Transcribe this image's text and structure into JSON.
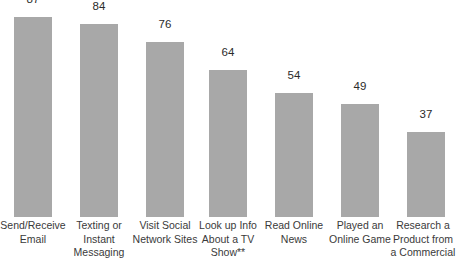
{
  "chart_data": {
    "type": "bar",
    "title": "",
    "xlabel": "",
    "ylabel": "",
    "ylim": [
      0,
      95
    ],
    "grid": false,
    "legend": null,
    "orientation": "vertical",
    "bar_color": "#a8a8a8",
    "background_color": "#ffffff",
    "value_label_color": "#2b2b2b",
    "category_label_color": "#3a3a3a",
    "categories": [
      "Send/Receive Email",
      "Texting or Instant Messaging",
      "Visit Social Network Sites",
      "Look up Info About a TV Show**",
      "Read Online News",
      "Played an Online Game",
      "Research a Product from a Commercial"
    ],
    "category_lines": [
      [
        "Send/Receive",
        "Email"
      ],
      [
        "Texting or",
        "Instant",
        "Messaging"
      ],
      [
        "Visit Social",
        "Network Sites"
      ],
      [
        "Look up Info",
        "About a TV",
        "Show**"
      ],
      [
        "Read Online",
        "News"
      ],
      [
        "Played an",
        "Online Game"
      ],
      [
        "Research a",
        "Product from",
        "a Commercial"
      ]
    ],
    "values": [
      87,
      84,
      76,
      64,
      54,
      49,
      37
    ],
    "value_labels": [
      "87",
      "84",
      "76",
      "64",
      "54",
      "49",
      "37"
    ]
  }
}
